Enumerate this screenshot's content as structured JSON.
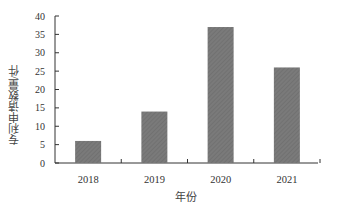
{
  "chart_data": {
    "type": "bar",
    "title": "",
    "xlabel": "年份",
    "ylabel": "专利申请数量/件",
    "categories": [
      "2018",
      "2019",
      "2020",
      "2021"
    ],
    "values": [
      6,
      14,
      37,
      26
    ],
    "ylim": [
      0,
      40
    ],
    "yticks": [
      0,
      5,
      10,
      15,
      20,
      25,
      30,
      35,
      40
    ],
    "grid": false,
    "legend": null,
    "bar_color": "#7a7a7a"
  }
}
